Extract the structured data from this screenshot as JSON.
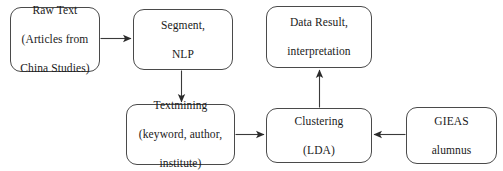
{
  "diagram": {
    "background_color": "#ffffff",
    "stroke_color": "#4a4a4a",
    "text_color": "#1a1a1a",
    "nodes": [
      {
        "id": "raw-text",
        "line1": "Raw Text",
        "line2": "(Articles from",
        "line3": "China Studies)",
        "italic_lines": [
          2,
          3
        ]
      },
      {
        "id": "segment",
        "line1": "Segment,",
        "line2": "NLP",
        "line3": ""
      },
      {
        "id": "data-result",
        "line1": "Data Result,",
        "line2": "interpretation",
        "line3": ""
      },
      {
        "id": "textmining",
        "line1": "Textmining",
        "line2": "(keyword, author,",
        "line3": "institute)"
      },
      {
        "id": "clustering",
        "line1": "Clustering",
        "line2": "(LDA)",
        "line3": ""
      },
      {
        "id": "gieas",
        "line1": "GIEAS",
        "line2": "alumnus",
        "line3": ""
      }
    ],
    "edges": [
      {
        "id": "raw-text-to-segment",
        "from": "raw-text",
        "to": "segment",
        "direction": "right"
      },
      {
        "id": "segment-to-textmining",
        "from": "segment",
        "to": "textmining",
        "direction": "down"
      },
      {
        "id": "textmining-to-clustering",
        "from": "textmining",
        "to": "clustering",
        "direction": "right"
      },
      {
        "id": "gieas-to-clustering",
        "from": "gieas",
        "to": "clustering",
        "direction": "left"
      },
      {
        "id": "clustering-to-data-result",
        "from": "clustering",
        "to": "data-result",
        "direction": "up"
      }
    ]
  }
}
